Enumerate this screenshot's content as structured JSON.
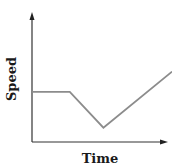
{
  "chart_data": {
    "type": "line",
    "title": "",
    "xlabel": "Time",
    "ylabel": "Speed",
    "grid": false,
    "legend": null,
    "axis_ticks": false,
    "x": [
      0,
      0.27,
      0.51,
      1.0
    ],
    "series": [
      {
        "name": "Speed",
        "values": [
          0.42,
          0.42,
          0.12,
          0.59
        ],
        "color": "#8c8c8c"
      }
    ],
    "annotations": "Constant speed, then decreasing to a minimum, then increasing steadily"
  },
  "colors": {
    "axis": "#333333",
    "line": "#8c8c8c"
  }
}
